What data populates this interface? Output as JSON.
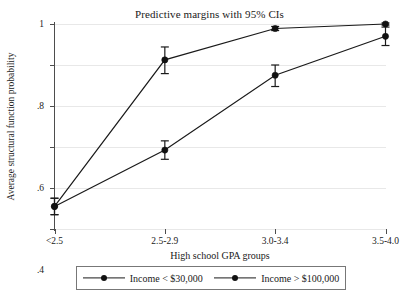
{
  "chart_data": {
    "type": "line",
    "title": "Predictive margins with 95% CIs",
    "xlabel": "High school GPA groups",
    "ylabel": "Average structural function probability",
    "categories": [
      "<2.5",
      "2.5-2.9",
      "3.0-3.4",
      "3.5-4.0"
    ],
    "ylim": [
      0,
      1
    ],
    "yticks": [
      0,
      0.2,
      0.4,
      0.6,
      0.8,
      1
    ],
    "ytick_labels": [
      "0",
      ".2",
      ".4",
      ".6",
      ".8",
      "1"
    ],
    "grid": true,
    "legend_position": "bottom",
    "series": [
      {
        "name": "Income < $30,000",
        "values": [
          0.11,
          0.385,
          0.75,
          0.94
        ],
        "ci_low": [
          0.07,
          0.34,
          0.695,
          0.895
        ],
        "ci_high": [
          0.15,
          0.43,
          0.8,
          0.985
        ]
      },
      {
        "name": "Income > $100,000",
        "values": [
          0.11,
          0.825,
          0.978,
          1.0
        ],
        "ci_low": [
          0.07,
          0.758,
          0.968,
          0.995
        ],
        "ci_high": [
          0.15,
          0.888,
          0.988,
          1.005
        ]
      }
    ]
  },
  "legend": {
    "entries": [
      {
        "label": "Income < $30,000"
      },
      {
        "label": "Income > $100,000"
      }
    ]
  }
}
